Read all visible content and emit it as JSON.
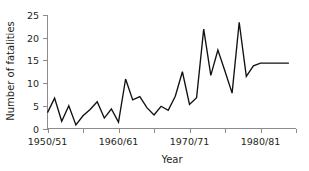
{
  "chart_data": {
    "type": "line",
    "title": "",
    "xlabel": "Year",
    "ylabel": "Number of fatalities",
    "xlim": [
      1950,
      1985
    ],
    "ylim": [
      0,
      25
    ],
    "grid": false,
    "legend": false,
    "y_ticks": [
      0,
      5,
      10,
      15,
      20,
      25
    ],
    "y_tick_labels": [
      "0",
      "5",
      "10",
      "15",
      "20",
      "25"
    ],
    "x_ticks": [
      1950,
      1955,
      1960,
      1965,
      1970,
      1975,
      1980,
      1985
    ],
    "x_tick_labels": [
      "1950/51",
      "",
      "1960/61",
      "",
      "1970/71",
      "",
      "1980/81",
      ""
    ],
    "x_labeled_ticks": [
      1950,
      1960,
      1970,
      1980
    ],
    "x_labeled_texts": [
      "1950/51",
      "1960/61",
      "1970/71",
      "1980/81"
    ],
    "series": [
      {
        "name": "Number of fatalities",
        "color": "#111111",
        "x": [
          1950,
          1951,
          1952,
          1953,
          1954,
          1955,
          1956,
          1957,
          1958,
          1959,
          1960,
          1961,
          1962,
          1963,
          1964,
          1965,
          1966,
          1967,
          1968,
          1969,
          1970,
          1971,
          1972,
          1973,
          1974,
          1975,
          1976,
          1977,
          1978,
          1979,
          1980,
          1981,
          1982,
          1983,
          1984
        ],
        "values": [
          3.5,
          6.7,
          1.6,
          5.0,
          0.8,
          2.8,
          4.2,
          5.9,
          2.3,
          4.3,
          1.4,
          10.9,
          6.3,
          7.0,
          4.6,
          3.0,
          4.9,
          4.0,
          7.1,
          12.5,
          5.3,
          6.8,
          21.9,
          11.7,
          17.3,
          12.6,
          7.8,
          23.4,
          11.5,
          13.8,
          14.4,
          14.4,
          14.4,
          14.4,
          14.4
        ]
      }
    ]
  },
  "axis": {
    "y_title": "Number of fatalities",
    "x_title": "Year"
  }
}
